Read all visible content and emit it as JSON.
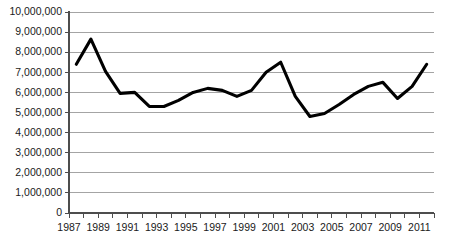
{
  "chart_data": {
    "type": "line",
    "title": "",
    "xlabel": "",
    "ylabel": "",
    "xlim": [
      1987,
      2012
    ],
    "ylim": [
      0,
      10000000
    ],
    "grid": true,
    "legend": false,
    "legend_position": "none",
    "line_color": "#000000",
    "gridline_color": "#9a9a9a",
    "axis_color": "#4d4d4d",
    "background_color": "#ffffff",
    "x": [
      1987.5,
      1988.5,
      1989.5,
      1990.5,
      1991.5,
      1992.5,
      1993.5,
      1994.5,
      1995.5,
      1996.5,
      1997.5,
      1998.5,
      1999.5,
      2000.5,
      2001.5,
      2002.5,
      2003.5,
      2004.5,
      2005.5,
      2006.5,
      2007.5,
      2008.5,
      2009.5,
      2010.5,
      2011.5
    ],
    "values": [
      7400000,
      8650000,
      7050000,
      5950000,
      6000000,
      5300000,
      5300000,
      5600000,
      6000000,
      6200000,
      6100000,
      5800000,
      6100000,
      7000000,
      7500000,
      5800000,
      4800000,
      4950000,
      5400000,
      5900000,
      6300000,
      6500000,
      5700000,
      6300000,
      7400000
    ],
    "categories": [
      "1987",
      "1988",
      "1989",
      "1990",
      "1991",
      "1992",
      "1993",
      "1994",
      "1995",
      "1996",
      "1997",
      "1998",
      "1999",
      "2000",
      "2001",
      "2002",
      "2003",
      "2004",
      "2005",
      "2006",
      "2007",
      "2008",
      "2009",
      "2010",
      "2011"
    ],
    "ytick_labels": [
      "10,000,000",
      "9,000,000",
      "8,000,000",
      "7,000,000",
      "6,000,000",
      "5,000,000",
      "4,000,000",
      "3,000,000",
      "2,000,000",
      "1,000,000",
      "0"
    ],
    "ytick_values": [
      10000000,
      9000000,
      8000000,
      7000000,
      6000000,
      5000000,
      4000000,
      3000000,
      2000000,
      1000000,
      0
    ],
    "xtick_labels": [
      "1987",
      "1989",
      "1991",
      "1993",
      "1995",
      "1997",
      "1999",
      "2001",
      "2003",
      "2005",
      "2007",
      "2009",
      "2011"
    ],
    "xtick_values": [
      1987,
      1989,
      1991,
      1993,
      1995,
      1997,
      1999,
      2001,
      2003,
      2005,
      2007,
      2009,
      2011
    ],
    "xminor_values": [
      1987,
      1988,
      1989,
      1990,
      1991,
      1992,
      1993,
      1994,
      1995,
      1996,
      1997,
      1998,
      1999,
      2000,
      2001,
      2002,
      2003,
      2004,
      2005,
      2006,
      2007,
      2008,
      2009,
      2010,
      2011,
      2012
    ]
  }
}
